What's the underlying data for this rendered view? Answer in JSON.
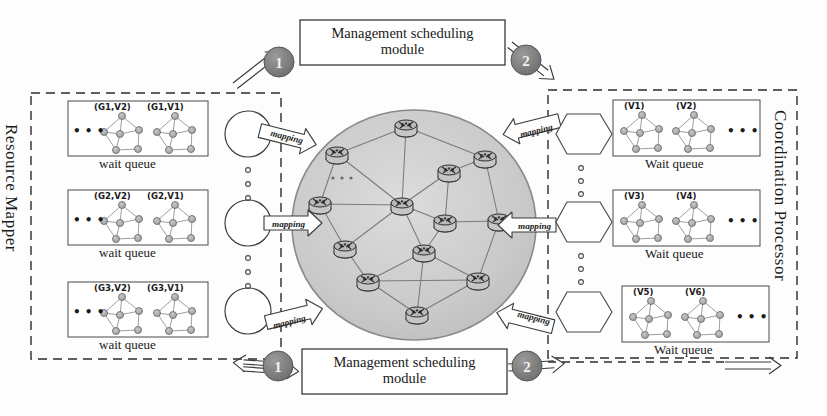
{
  "diagram": {
    "colors": {
      "cloud_fill": "#cdcdcd",
      "cloud_stroke": "#7b7b7b",
      "badge_fill": "#7d7d7d",
      "badge_text": "#f2f2f2",
      "node_fill": "#b0b0b0",
      "line": "#3a3a3a",
      "dashed": "#2b2b2b"
    }
  },
  "left_panel": {
    "label": "Resource Mapper",
    "queues": [
      {
        "queue_label": "wait queue",
        "ellipsis": "• • •",
        "graphs": [
          {
            "label": "(G1,V2)"
          },
          {
            "label": "(G1,V1)"
          }
        ]
      },
      {
        "queue_label": "wait queue",
        "ellipsis": "• • •",
        "graphs": [
          {
            "label": "(G2,V2)"
          },
          {
            "label": "(G2,V1)"
          }
        ]
      },
      {
        "queue_label": "wait queue",
        "ellipsis": "• • •",
        "graphs": [
          {
            "label": "(G3,V2)"
          },
          {
            "label": "(G3,V1)"
          }
        ]
      }
    ]
  },
  "right_panel": {
    "label": "Coordination  Processor",
    "queues": [
      {
        "queue_label": "Wait queue",
        "ellipsis": "• • •",
        "graphs": [
          {
            "label": "(V1)"
          },
          {
            "label": "(V2)"
          }
        ]
      },
      {
        "queue_label": "Wait queue",
        "ellipsis": "• • •",
        "graphs": [
          {
            "label": "(V3)"
          },
          {
            "label": "(V4)"
          }
        ]
      },
      {
        "queue_label": "Wait queue",
        "ellipsis": "• • •",
        "graphs": [
          {
            "label": "(V5)"
          },
          {
            "label": "(V6)"
          }
        ]
      }
    ]
  },
  "modules": {
    "top": {
      "line1": "Management scheduling",
      "line2": "module"
    },
    "bottom": {
      "line1": "Management scheduling",
      "line2": "module"
    }
  },
  "badges": {
    "top_left": "1",
    "top_right": "2",
    "bottom_left": "1",
    "bottom_right": "2"
  },
  "mapping_arrows": {
    "left": [
      "mapping",
      "mapping",
      "mapping"
    ],
    "right": [
      "mapping",
      "mapping",
      "mapping"
    ]
  },
  "network_cloud": {
    "node_count": 13,
    "node_icon": "router-icon",
    "inner_ellipsis": "• • •"
  },
  "vertical_dots": {
    "left_groups": 2,
    "right_groups": 2,
    "dots_per_group": 3
  }
}
